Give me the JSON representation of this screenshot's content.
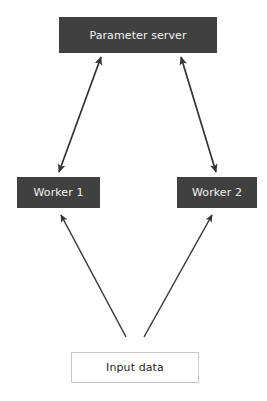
{
  "diagram": {
    "canvas": {
      "width": 267,
      "height": 401,
      "background": "#ffffff"
    },
    "colors": {
      "node_fill": "#404040",
      "node_text_light": "#f2f2f2",
      "node_text_dark": "#262626",
      "node_outline_fill": "#ffffff",
      "node_outline_border": "#c9c9c9",
      "arrow": "#333333"
    },
    "nodes": [
      {
        "id": "parameter-server",
        "label": "Parameter server",
        "style": "filled"
      },
      {
        "id": "worker-1",
        "label": "Worker 1",
        "style": "filled"
      },
      {
        "id": "worker-2",
        "label": "Worker 2",
        "style": "filled"
      },
      {
        "id": "input-data",
        "label": "Input data",
        "style": "outline"
      }
    ],
    "edges": [
      {
        "id": "edge-ps-worker1",
        "from": "parameter-server",
        "to": "worker-1",
        "heads": "both",
        "x1": 101,
        "y1": 57,
        "x2": 59,
        "y2": 172
      },
      {
        "id": "edge-ps-worker2",
        "from": "parameter-server",
        "to": "worker-2",
        "heads": "both",
        "x1": 181,
        "y1": 57,
        "x2": 216,
        "y2": 172
      },
      {
        "id": "edge-input-worker1",
        "from": "input-data",
        "to": "worker-1",
        "heads": "end",
        "x1": 126,
        "y1": 337,
        "x2": 61,
        "y2": 215
      },
      {
        "id": "edge-input-worker2",
        "from": "input-data",
        "to": "worker-2",
        "heads": "end",
        "x1": 144,
        "y1": 337,
        "x2": 212,
        "y2": 215
      }
    ]
  }
}
